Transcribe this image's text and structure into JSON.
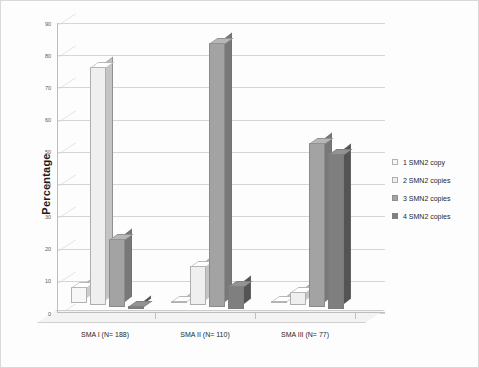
{
  "chart_data": {
    "type": "bar",
    "title": "",
    "subtitle": "",
    "xlabel": "",
    "ylabel": "Percentage",
    "ylim": [
      0,
      90
    ],
    "yticks": [
      0,
      10,
      20,
      30,
      40,
      50,
      60,
      70,
      80,
      90
    ],
    "grid": true,
    "legend_position": "right",
    "style": "3d-column",
    "categories": [
      "SMA I (N= 188)",
      "SMA II (N= 110)",
      "SMA III (N= 77)"
    ],
    "series": [
      {
        "name": "1 SMN2 copy",
        "color": "#f7f7f7",
        "values": [
          5,
          0.5,
          0.5
        ]
      },
      {
        "name": "2 SMN2 copies",
        "color": "#efefef",
        "values": [
          74,
          12,
          4
        ]
      },
      {
        "name": "3 SMN2 copies",
        "color": "#a3a3a3",
        "values": [
          21,
          82,
          51
        ]
      },
      {
        "name": "4 SMN2 copies",
        "color": "#7f7f7f",
        "values": [
          1,
          7,
          48
        ]
      }
    ]
  },
  "axis": {
    "y_title": "Percentage",
    "y_tick_labels": [
      "0",
      "10",
      "20",
      "30",
      "40",
      "50",
      "60",
      "70",
      "80",
      "90"
    ],
    "x_tick_labels": [
      "SMA I (N= 188)",
      "SMA II (N= 110)",
      "SMA III (N= 77)"
    ]
  },
  "legend": {
    "items": [
      {
        "label": "1 SMN2 copy",
        "swatch": "#f7f7f7"
      },
      {
        "label": "2 SMN2 copies",
        "swatch": "#efefef"
      },
      {
        "label": "3 SMN2 copies",
        "swatch": "#a3a3a3"
      },
      {
        "label": "4 SMN2 copies",
        "swatch": "#7f7f7f"
      }
    ]
  },
  "colors": {
    "background": "#fdfdfd",
    "border": "#d8d8d8",
    "gridline": "#d6d6d6",
    "axis": "#bdbdbd",
    "text": "#1f1f1f"
  }
}
